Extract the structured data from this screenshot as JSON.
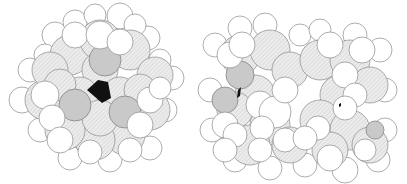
{
  "figure": {
    "panels": [
      {
        "name": "left-model",
        "view": "top view with central cavity",
        "cavity_color": "#111111"
      },
      {
        "name": "right-model",
        "view": "side view, dimeric assembly",
        "cavity_color": "#111111"
      }
    ],
    "colors": {
      "hydrogen": "#ffffff",
      "carbon_hatch": "#e4e4e4",
      "oxygen": "#c9c9c9",
      "outline": "#8a8a8a",
      "background": "#ffffff"
    }
  }
}
